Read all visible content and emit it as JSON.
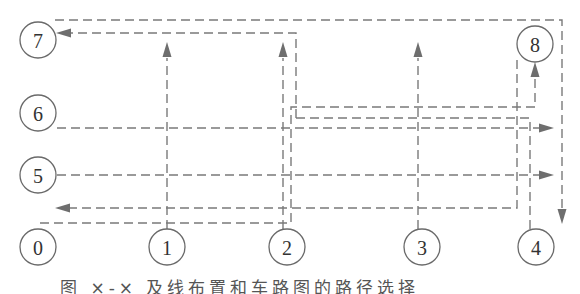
{
  "diagram": {
    "type": "route-diagram",
    "nodes": [
      {
        "id": "0",
        "label": "0",
        "x": 38,
        "y": 247
      },
      {
        "id": "1",
        "label": "1",
        "x": 167,
        "y": 247
      },
      {
        "id": "2",
        "label": "2",
        "x": 287,
        "y": 247
      },
      {
        "id": "3",
        "label": "3",
        "x": 422,
        "y": 247
      },
      {
        "id": "4",
        "label": "4",
        "x": 536,
        "y": 247
      },
      {
        "id": "5",
        "label": "5",
        "x": 38,
        "y": 175
      },
      {
        "id": "6",
        "label": "6",
        "x": 38,
        "y": 113
      },
      {
        "id": "7",
        "label": "7",
        "x": 38,
        "y": 40
      },
      {
        "id": "8",
        "label": "8",
        "x": 535,
        "y": 44
      }
    ],
    "routes": [
      {
        "name": "top-loop",
        "points": "55,20 562,20 562,220",
        "arrow": "down",
        "arrow_at": [
          562,
          222
        ]
      },
      {
        "name": "to-node-7",
        "points": "296,118 296,33 64,33",
        "arrow": "left",
        "arrow_at": [
          58,
          33
        ]
      },
      {
        "name": "node-6-row",
        "points": "57,128 540,128",
        "arrow": "right",
        "arrow_at": [
          552,
          128
        ]
      },
      {
        "name": "node-5-row",
        "points": "57,175 540,175",
        "arrow": "right",
        "arrow_at": [
          552,
          175
        ]
      },
      {
        "name": "return-row",
        "points": "517,60 517,208 70,208",
        "arrow": "left",
        "arrow_at": [
          57,
          208
        ]
      },
      {
        "name": "to-node-8",
        "points": "40,223 291,223 291,107 535,107 535,74",
        "arrow": "up",
        "arrow_at": [
          535,
          64
        ]
      },
      {
        "name": "upper-mid-row",
        "points": "296,118 530,118",
        "arrow": "none"
      },
      {
        "name": "node-1-vertical",
        "points": "167,229 167,58",
        "arrow": "up",
        "arrow_at": [
          167,
          44
        ]
      },
      {
        "name": "node-2-vertical",
        "points": "283,229 283,58",
        "arrow": "up",
        "arrow_at": [
          283,
          44
        ]
      },
      {
        "name": "node-3-vertical",
        "points": "418,229 418,58",
        "arrow": "up",
        "arrow_at": [
          418,
          44
        ]
      },
      {
        "name": "node-4-vertical",
        "points": "530,229 530,118",
        "arrow": "none"
      }
    ]
  },
  "caption": "图 ×-× 及线布置和车路图的路径选择"
}
